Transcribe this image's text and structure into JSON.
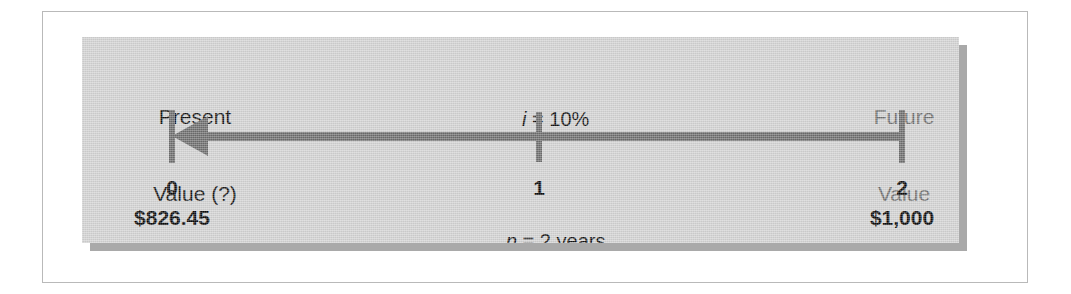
{
  "figure": {
    "type": "timeline-diagram",
    "panel_color": "#d2d2d2",
    "shadow_color": "#a9a9a9",
    "line_color": "#6d6d6d",
    "text_color": "#111111",
    "muted_text_color": "#6f6f6f",
    "frame_border_color": "#b9b9b9"
  },
  "labels": {
    "present_value_line1": "Present",
    "present_value_line2": "Value (?)",
    "future_value_line1": "Future",
    "future_value_line2": "Value",
    "interest_rate_italic": "i",
    "interest_rate_rest": " = 10%",
    "periods_italic": "n",
    "periods_rest": " = 2 years"
  },
  "timeline": {
    "ticks": [
      {
        "period": "0",
        "amount": "$826.45"
      },
      {
        "period": "1",
        "amount": ""
      },
      {
        "period": "2",
        "amount": "$1,000"
      }
    ],
    "arrow_direction": "left",
    "arrow_description": "discounting arrow from period 2 back to period 0"
  }
}
